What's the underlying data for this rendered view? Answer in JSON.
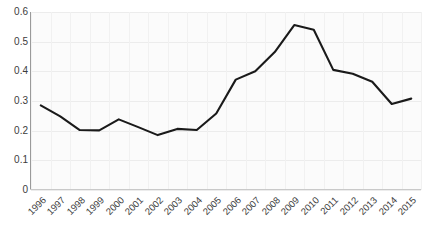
{
  "chart_data": {
    "type": "line",
    "title": "",
    "subtitle": "",
    "xlabel": "",
    "ylabel": "",
    "categories": [
      "1996",
      "1997",
      "1998",
      "1999",
      "2000",
      "2001",
      "2002",
      "2003",
      "2004",
      "2005",
      "2006",
      "2007",
      "2008",
      "2009",
      "2010",
      "2011",
      "2012",
      "2013",
      "2014",
      "2015"
    ],
    "series": [
      {
        "name": "series-1",
        "color": "#1a1a1a",
        "values": [
          0.285,
          0.248,
          0.202,
          0.201,
          0.238,
          0.212,
          0.185,
          0.206,
          0.202,
          0.258,
          0.372,
          0.4,
          0.465,
          0.556,
          0.54,
          0.405,
          0.392,
          0.365,
          0.29,
          0.308
        ]
      }
    ],
    "ylim": [
      0,
      0.6
    ],
    "yticks": [
      0,
      0.1,
      0.2,
      0.3,
      0.4,
      0.5,
      0.6
    ],
    "ytick_labels": [
      "0",
      "0.1",
      "0.2",
      "0.3",
      "0.4",
      "0.5",
      "0.6"
    ],
    "grid": true,
    "grid_color": "#ececec",
    "legend": "none",
    "legend_position": "none",
    "plot_background": "#fbfbfb",
    "axis_color": "#9a9a9a",
    "tick_label_color": "#3c3c3c",
    "xtick_rotation": -45,
    "annotations": []
  }
}
